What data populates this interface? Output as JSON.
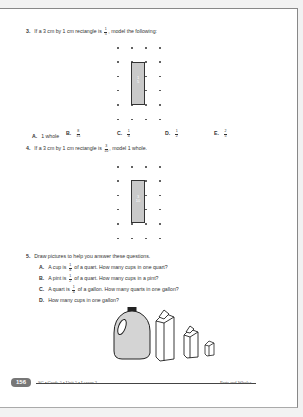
{
  "q3": {
    "number": "3.",
    "text_before": "If a 3 cm by 1 cm rectangle is",
    "fraction": {
      "num": "1",
      "den": "5"
    },
    "text_after": ", model the following:",
    "rect_label": {
      "num": "1",
      "den": "5"
    },
    "choices": [
      {
        "letter": "A.",
        "value": "1 whole"
      },
      {
        "letter": "B.",
        "num": "8",
        "den": "15"
      },
      {
        "letter": "C.",
        "num": "1",
        "den": "4"
      },
      {
        "letter": "D.",
        "num": "1",
        "den": "2"
      },
      {
        "letter": "E.",
        "num": "2",
        "den": "5"
      }
    ]
  },
  "q4": {
    "number": "4.",
    "text_before": "If a 3 cm by 1 cm rectangle is",
    "fraction": {
      "num": "3",
      "den": "10"
    },
    "text_after": ", model 1 whole.",
    "rect_label": {
      "num": "3",
      "den": "10"
    }
  },
  "q5": {
    "number": "5.",
    "text": "Draw pictures to help you answer these questions.",
    "items": [
      {
        "letter": "A.",
        "before": "A cup is",
        "num": "1",
        "den": "4",
        "after": "of a quart. How many cups in one quart?"
      },
      {
        "letter": "B.",
        "before": "A pint is",
        "num": "1",
        "den": "2",
        "after": "of a quart. How many cups in a pint?"
      },
      {
        "letter": "C.",
        "before": "A quart is",
        "num": "1",
        "den": "4",
        "after": "of a gallon. How many quarts in one gallon?"
      },
      {
        "letter": "D.",
        "before": "How many cups in one gallon?",
        "num": "",
        "den": "",
        "after": ""
      }
    ]
  },
  "footer": {
    "page_number": "156",
    "left": "SG • Grade 5 • Unit 5 • Lesson 2",
    "right": "Parts and Wholes"
  },
  "colors": {
    "rect_fill": "#c9c9c9",
    "page_badge": "#777777"
  }
}
